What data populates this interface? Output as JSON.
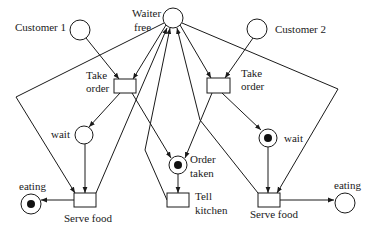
{
  "diagram": {
    "type": "petri-net",
    "places": {
      "customer1": {
        "label": "Customer 1",
        "tokens": 0
      },
      "waiter_free": {
        "label_line1": "Waiter",
        "label_line2": "free",
        "tokens": 0
      },
      "customer2": {
        "label": "Customer 2",
        "tokens": 0
      },
      "wait1": {
        "label": "wait",
        "tokens": 0
      },
      "order_taken": {
        "label_line1": "Order",
        "label_line2": "taken",
        "tokens": 1
      },
      "wait2": {
        "label": "wait",
        "tokens": 1
      },
      "eating1": {
        "label": "eating",
        "tokens": 1
      },
      "eating2": {
        "label": "eating",
        "tokens": 0
      }
    },
    "transitions": {
      "take_order1": {
        "label_line1": "Take",
        "label_line2": "order"
      },
      "take_order2": {
        "label_line1": "Take",
        "label_line2": "order"
      },
      "serve_food1": {
        "label": "Serve food"
      },
      "tell_kitchen": {
        "label_line1": "Tell",
        "label_line2": "kitchen"
      },
      "serve_food2": {
        "label": "Serve food"
      }
    },
    "colors": {
      "ink": "#1a1a1a",
      "background": "#ffffff"
    }
  }
}
